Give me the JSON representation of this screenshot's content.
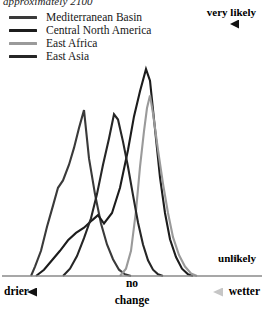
{
  "caption": {
    "text": "approximately 2100"
  },
  "legend": {
    "items": [
      {
        "label": "Mediterranean Basin",
        "color": "#3a3a3a",
        "key": "mediterranean-basin"
      },
      {
        "label": "Central North America",
        "color": "#1c1c1c",
        "key": "central-north-america"
      },
      {
        "label": "East Africa",
        "color": "#9a9a9a",
        "key": "east-africa"
      },
      {
        "label": "East Asia",
        "color": "#262626",
        "key": "east-asia"
      }
    ]
  },
  "axes": {
    "vertical": {
      "top_label": "very likely",
      "bottom_label": "unlikely",
      "arrow_top_color": "#1a1a1a",
      "arrow_bottom_color": "#c9c9c9"
    },
    "horizontal": {
      "left_label": "drier",
      "right_label": "wetter",
      "center_label_line1": "no",
      "center_label_line2": "change",
      "arrow_left_color": "#1a1a1a",
      "arrow_right_color": "#c6c6c6",
      "baseline_color": "#8a8a8a"
    }
  },
  "chart_data": {
    "type": "line",
    "title": "approximately 2100",
    "xlabel": "drier — no change — wetter",
    "ylabel": "likelihood (unlikely to very likely)",
    "xlim": [
      0,
      264
    ],
    "ylim": [
      0,
      1
    ],
    "grid": false,
    "legend_position": "top-left",
    "annotations": [
      "very likely",
      "unlikely",
      "drier",
      "no change",
      "wetter"
    ],
    "series": [
      {
        "name": "Mediterranean Basin",
        "color": "#3a3a3a",
        "comment": "leftmost broad peak — strongest drying signal",
        "points": [
          [
            31,
            0.0
          ],
          [
            35,
            0.045
          ],
          [
            41,
            0.12
          ],
          [
            47,
            0.235
          ],
          [
            53,
            0.335
          ],
          [
            58,
            0.42
          ],
          [
            63,
            0.455
          ],
          [
            69,
            0.53
          ],
          [
            74,
            0.61
          ],
          [
            79,
            0.705
          ],
          [
            84,
            0.79
          ],
          [
            89,
            0.56
          ],
          [
            95,
            0.39
          ],
          [
            101,
            0.25
          ],
          [
            107,
            0.15
          ],
          [
            113,
            0.08
          ],
          [
            119,
            0.03
          ],
          [
            125,
            0.008
          ],
          [
            131,
            0.0
          ]
        ]
      },
      {
        "name": "Central North America",
        "color": "#1c1c1c",
        "comment": "low broad shoulder at left rising to tall narrow central peak",
        "points": [
          [
            36,
            0.0
          ],
          [
            44,
            0.03
          ],
          [
            52,
            0.075
          ],
          [
            60,
            0.12
          ],
          [
            68,
            0.17
          ],
          [
            76,
            0.205
          ],
          [
            84,
            0.23
          ],
          [
            92,
            0.265
          ],
          [
            98,
            0.29
          ],
          [
            104,
            0.25
          ],
          [
            112,
            0.3
          ],
          [
            120,
            0.42
          ],
          [
            128,
            0.6
          ],
          [
            134,
            0.76
          ],
          [
            140,
            0.88
          ],
          [
            146,
            0.985
          ],
          [
            150,
            0.93
          ],
          [
            155,
            0.7
          ],
          [
            160,
            0.47
          ],
          [
            165,
            0.3
          ],
          [
            170,
            0.175
          ],
          [
            176,
            0.09
          ],
          [
            182,
            0.035
          ],
          [
            188,
            0.008
          ],
          [
            193,
            0.0
          ]
        ]
      },
      {
        "name": "East Africa",
        "color": "#9a9a9a",
        "comment": "narrow peak just left of and slightly lower than the black central peak",
        "points": [
          [
            120,
            0.0
          ],
          [
            126,
            0.035
          ],
          [
            131,
            0.12
          ],
          [
            136,
            0.31
          ],
          [
            140,
            0.52
          ],
          [
            144,
            0.69
          ],
          [
            147,
            0.8
          ],
          [
            150,
            0.86
          ],
          [
            153,
            0.775
          ],
          [
            158,
            0.6
          ],
          [
            163,
            0.44
          ],
          [
            168,
            0.3
          ],
          [
            173,
            0.185
          ],
          [
            179,
            0.1
          ],
          [
            185,
            0.045
          ],
          [
            191,
            0.012
          ],
          [
            197,
            0.0
          ]
        ]
      },
      {
        "name": "East Asia",
        "color": "#262626",
        "comment": "mid-left peak crossing the Mediterranean curve, falls steeply to baseline",
        "points": [
          [
            63,
            0.0
          ],
          [
            70,
            0.035
          ],
          [
            77,
            0.095
          ],
          [
            84,
            0.18
          ],
          [
            91,
            0.275
          ],
          [
            97,
            0.39
          ],
          [
            103,
            0.53
          ],
          [
            109,
            0.655
          ],
          [
            114,
            0.77
          ],
          [
            118,
            0.745
          ],
          [
            123,
            0.64
          ],
          [
            128,
            0.52
          ],
          [
            133,
            0.385
          ],
          [
            138,
            0.255
          ],
          [
            143,
            0.15
          ],
          [
            148,
            0.075
          ],
          [
            153,
            0.03
          ],
          [
            158,
            0.008
          ],
          [
            163,
            0.0
          ]
        ]
      }
    ]
  }
}
